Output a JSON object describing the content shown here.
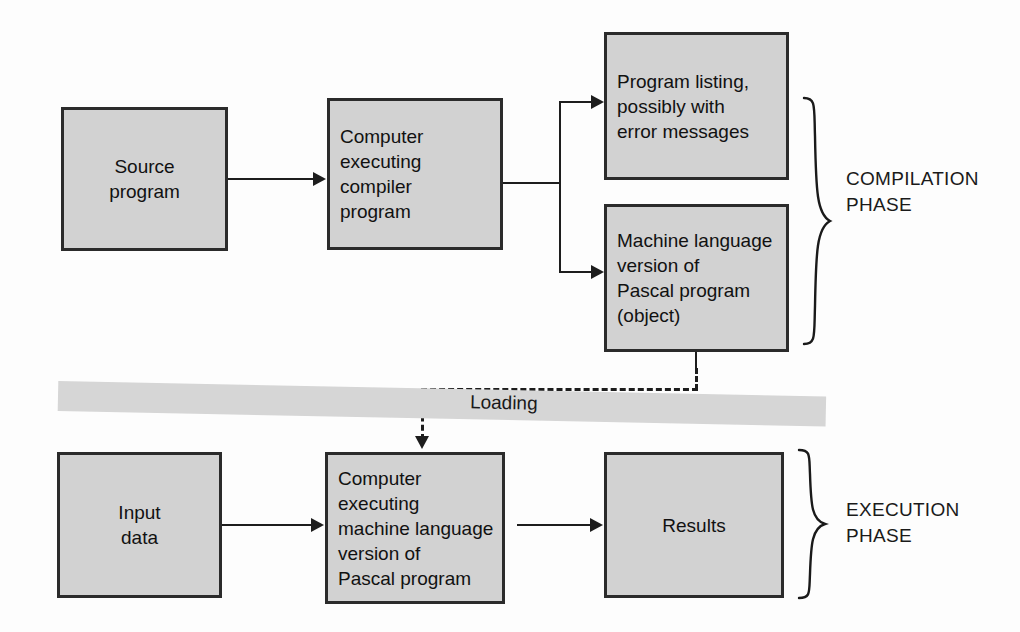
{
  "diagram": {
    "colors": {
      "box_fill": "#d2d2d2",
      "box_border": "#2b2b2b",
      "line": "#1d1d1d",
      "band_fill": "#d6d6d6",
      "background": "#fdfdfd"
    }
  },
  "boxes": {
    "source": {
      "text": "Source\nprogram"
    },
    "compiler": {
      "text": "Computer\nexecuting\ncompiler\nprogram"
    },
    "listing": {
      "text": "Program listing,\npossibly with\nerror messages"
    },
    "machine": {
      "text": "Machine language\nversion of\nPascal program\n(object)"
    },
    "input": {
      "text": "Input\ndata"
    },
    "executor": {
      "text": "Computer\nexecuting\nmachine language\nversion of\nPascal program"
    },
    "results": {
      "text": "Results"
    }
  },
  "band": {
    "label": "Loading"
  },
  "phases": {
    "compilation": "COMPILATION\nPHASE",
    "execution": "EXECUTION\nPHASE"
  }
}
